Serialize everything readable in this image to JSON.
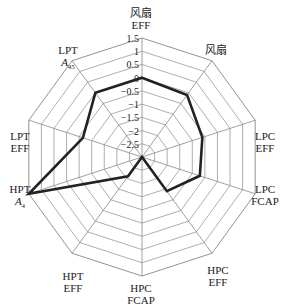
{
  "chart_data": {
    "type": "radar",
    "title": "",
    "axes": [
      "风扇 EFF",
      "风扇",
      "LPC EFF",
      "LPC FCAP",
      "HPC EFF",
      "HPC FCAP",
      "HPT EFF",
      "HPT A4",
      "LPT EFF",
      "LPT A45"
    ],
    "axis_labels": [
      {
        "line1": "风扇",
        "line2": "EFF"
      },
      {
        "line1": "风扇",
        "line2": ""
      },
      {
        "line1": "LPC",
        "line2": "EFF"
      },
      {
        "line1": "LPC",
        "line2": "FCAP"
      },
      {
        "line1": "HPC",
        "line2": "EFF"
      },
      {
        "line1": "HPC",
        "line2": "FCAP"
      },
      {
        "line1": "HPT",
        "line2": "EFF"
      },
      {
        "line1": "HPT",
        "line2": "A4"
      },
      {
        "line1": "LPT",
        "line2": "EFF"
      },
      {
        "line1": "LPT",
        "line2": "A45"
      }
    ],
    "ticks": [
      "1.5",
      "1",
      "0.5",
      "0",
      "−0.5",
      "−1",
      "−1.5",
      "−2",
      "−2.5"
    ],
    "rlim": [
      -3,
      1.5
    ],
    "series": [
      {
        "name": "",
        "values": [
          0,
          -0.1,
          -0.6,
          -0.7,
          -1.4,
          -3,
          -2.1,
          1.5,
          -0.65,
          0
        ]
      }
    ],
    "grid": true
  }
}
